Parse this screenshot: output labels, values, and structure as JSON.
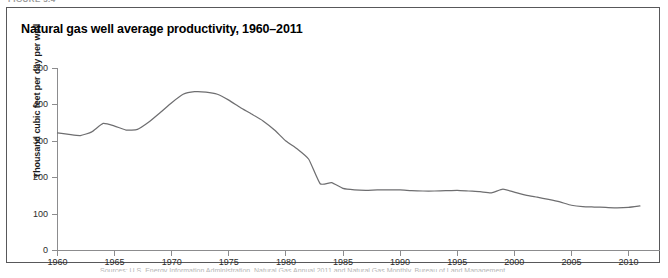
{
  "page": {
    "running_head": "FIGURE 3.4",
    "source_note": "Sources: U.S. Energy Information Administration, Natural Gas Annual 2011 and Natural Gas Monthly, Bureau of Land Management."
  },
  "figure": {
    "title": "Natural gas well average productivity, 1960–2011"
  },
  "axis": {
    "y_title": "Thousand cubic feet per day per well",
    "y_ticks": [
      "0",
      "100",
      "200",
      "300",
      "400",
      "500"
    ],
    "x_ticks": [
      "1960",
      "1965",
      "1970",
      "1975",
      "1980",
      "1985",
      "1990",
      "1995",
      "2000",
      "2005",
      "2010"
    ]
  },
  "chart_data": {
    "type": "line",
    "title": "Natural gas well average productivity, 1960–2011",
    "xlabel": "",
    "ylabel": "Thousand cubic feet per day per well",
    "xlim": [
      1960,
      2011
    ],
    "ylim": [
      0,
      500
    ],
    "yticks": [
      0,
      100,
      200,
      300,
      400,
      500
    ],
    "xticks": [
      1960,
      1965,
      1970,
      1975,
      1980,
      1985,
      1990,
      1995,
      2000,
      2005,
      2010
    ],
    "grid": false,
    "legend": "none",
    "series": [
      {
        "name": "Natural gas well average productivity",
        "color": "#6e6e70",
        "x": [
          1960,
          1961,
          1962,
          1963,
          1964,
          1965,
          1966,
          1967,
          1968,
          1969,
          1970,
          1971,
          1972,
          1973,
          1974,
          1975,
          1976,
          1977,
          1978,
          1979,
          1980,
          1981,
          1982,
          1983,
          1984,
          1985,
          1986,
          1987,
          1988,
          1989,
          1990,
          1991,
          1992,
          1993,
          1994,
          1995,
          1996,
          1997,
          1998,
          1999,
          2000,
          2001,
          2002,
          2003,
          2004,
          2005,
          2006,
          2007,
          2008,
          2009,
          2010,
          2011
        ],
        "values": [
          322,
          318,
          315,
          325,
          348,
          341,
          330,
          332,
          352,
          378,
          405,
          428,
          435,
          434,
          428,
          412,
          392,
          374,
          355,
          330,
          300,
          278,
          250,
          183,
          186,
          170,
          166,
          165,
          166,
          166,
          166,
          164,
          163,
          163,
          164,
          165,
          163,
          161,
          158,
          168,
          160,
          152,
          146,
          140,
          133,
          124,
          120,
          119,
          118,
          117,
          118,
          122
        ]
      }
    ]
  }
}
